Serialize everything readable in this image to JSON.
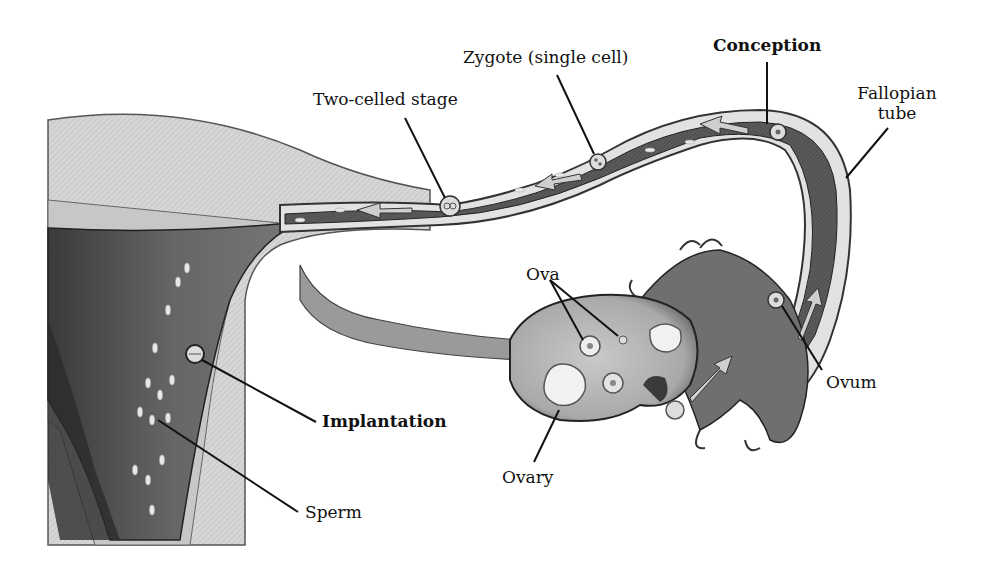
{
  "diagram": {
    "labels": {
      "two_celled_stage": "Two-celled stage",
      "zygote": "Zygote (single cell)",
      "conception": "Conception",
      "fallopian_tube_line1": "Fallopian",
      "fallopian_tube_line2": "tube",
      "ova": "Ova",
      "ovum": "Ovum",
      "ovary": "Ovary",
      "implantation": "Implantation",
      "sperm": "Sperm"
    },
    "colors": {
      "background": "#ffffff",
      "tissue_light": "#d9d9d9",
      "tissue_mid": "#9a9a9a",
      "tissue_dark": "#3a3a3a",
      "cavity": "#555555",
      "line": "#111111"
    }
  }
}
